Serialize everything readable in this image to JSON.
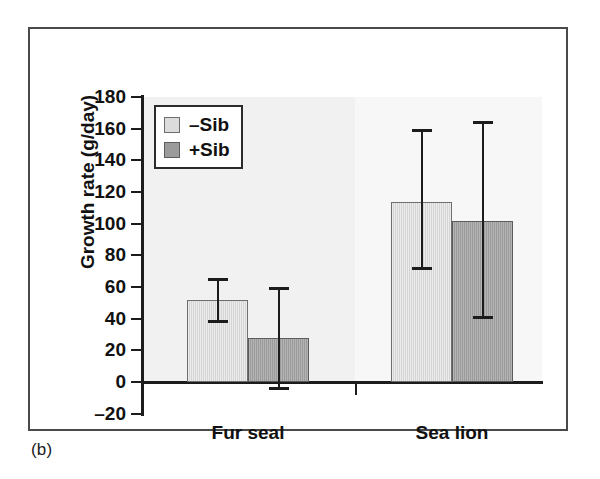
{
  "figure": {
    "caption": "(b)"
  },
  "chart_data": {
    "type": "bar",
    "title": "",
    "xlabel": "",
    "ylabel": "Growth rate (g/day)",
    "categories": [
      "Fur seal",
      "Sea lion"
    ],
    "series": [
      {
        "name": "–Sib",
        "color": "#d5d5d5",
        "values": [
          52,
          114
        ],
        "error_upper": [
          66,
          160
        ],
        "error_lower": [
          37,
          71
        ]
      },
      {
        "name": "+Sib",
        "color": "#9b9b9b",
        "values": [
          28,
          102
        ],
        "error_upper": [
          60,
          165
        ],
        "error_lower": [
          -5,
          40
        ]
      }
    ],
    "ylim": [
      -20,
      180
    ],
    "ytick_labels": [
      "180",
      "160",
      "140",
      "120",
      "100",
      "80",
      "60",
      "40",
      "20",
      "0",
      "–20"
    ],
    "ytick_values": [
      180,
      160,
      140,
      120,
      100,
      80,
      60,
      40,
      20,
      0,
      -20
    ],
    "grid": false,
    "legend_position": "top-left",
    "legend_entries": [
      "–Sib",
      "+Sib"
    ]
  }
}
